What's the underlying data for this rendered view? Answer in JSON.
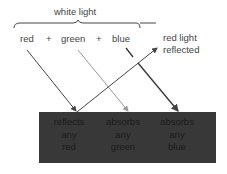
{
  "title": "white light",
  "components": [
    "red",
    "green",
    "blue"
  ],
  "plus": "+",
  "reflected_label": [
    "red light",
    "reflected"
  ],
  "surface": {
    "color": "#383838",
    "columns": [
      {
        "lines": [
          "reflects",
          "any",
          "red"
        ]
      },
      {
        "lines": [
          "absorbs",
          "any",
          "green"
        ]
      },
      {
        "lines": [
          "absorbs",
          "any",
          "blue"
        ]
      }
    ]
  }
}
